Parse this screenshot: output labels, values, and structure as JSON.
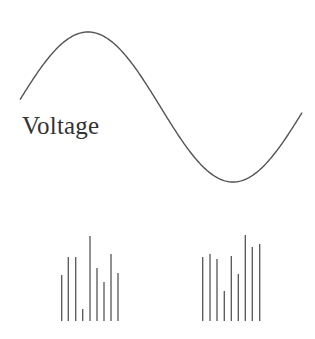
{
  "diagram": {
    "label": "Voltage",
    "colors": {
      "line": "#555555",
      "text": "#333333",
      "background": "#ffffff"
    },
    "wave": {
      "type": "sine",
      "start": [
        20,
        96
      ],
      "peak": [
        88,
        32
      ],
      "trough": [
        233,
        182
      ],
      "end": [
        302,
        96
      ]
    },
    "bar_groups": [
      {
        "name": "left-group",
        "baseline_y": 321,
        "bars": [
          {
            "x": 61.7,
            "top": 275
          },
          {
            "x": 68.3,
            "top": 257
          },
          {
            "x": 75.7,
            "top": 257
          },
          {
            "x": 82.7,
            "top": 309
          },
          {
            "x": 90,
            "top": 236
          },
          {
            "x": 97,
            "top": 268
          },
          {
            "x": 104,
            "top": 282
          },
          {
            "x": 111,
            "top": 254
          },
          {
            "x": 118,
            "top": 273
          }
        ]
      },
      {
        "name": "right-group",
        "baseline_y": 321,
        "bars": [
          {
            "x": 202.7,
            "top": 257
          },
          {
            "x": 210,
            "top": 254
          },
          {
            "x": 217,
            "top": 259
          },
          {
            "x": 224.3,
            "top": 291
          },
          {
            "x": 231.3,
            "top": 256
          },
          {
            "x": 238.3,
            "top": 274
          },
          {
            "x": 245.3,
            "top": 235
          },
          {
            "x": 252.3,
            "top": 247
          },
          {
            "x": 259.7,
            "top": 244
          }
        ]
      }
    ]
  }
}
